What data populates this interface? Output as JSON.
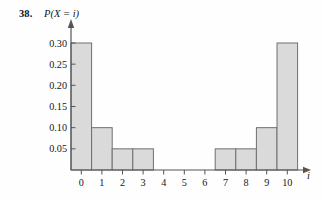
{
  "figure": {
    "problem_number": "38.",
    "x_axis_title": "i",
    "y_axis_title": "P(X = i)"
  },
  "chart_data": {
    "type": "bar",
    "title": "",
    "subtitle": "",
    "xlabel": "i",
    "ylabel": "P(X = i)",
    "categories": [
      "0",
      "1",
      "2",
      "3",
      "4",
      "5",
      "6",
      "7",
      "8",
      "9",
      "10"
    ],
    "values": [
      0.3,
      0.1,
      0.05,
      0.05,
      0,
      0,
      0,
      0.05,
      0.05,
      0.1,
      0.3
    ],
    "x": [
      0,
      1,
      2,
      3,
      4,
      5,
      6,
      7,
      8,
      9,
      10
    ],
    "xlim": [
      -0.5,
      11.0
    ],
    "ylim": [
      0,
      0.325
    ],
    "y_ticks": [
      0.05,
      0.1,
      0.15,
      0.2,
      0.25,
      0.3
    ],
    "y_tick_labels": [
      "0.05",
      "0.10",
      "0.15",
      "0.20",
      "0.25",
      "0.30"
    ],
    "x_ticks": [
      0,
      1,
      2,
      3,
      4,
      5,
      6,
      7,
      8,
      9,
      10
    ],
    "x_tick_labels": [
      "0",
      "1",
      "2",
      "3",
      "4",
      "5",
      "6",
      "7",
      "8",
      "9",
      "10"
    ],
    "grid": false,
    "legend": "none",
    "bar_width": 1.0,
    "bar_fill_color": "#dadada",
    "bar_edge_color": "#6f6f6f",
    "axis_color": "#555555",
    "background_color": "#fefefe"
  }
}
